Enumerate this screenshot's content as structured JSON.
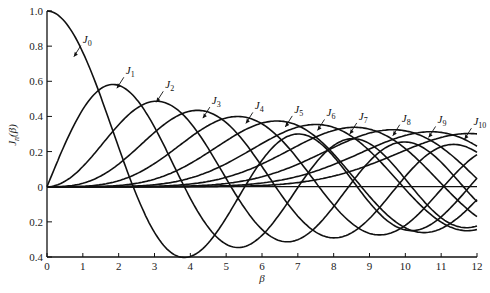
{
  "chart_data": {
    "type": "line",
    "title": "",
    "xlabel": "β",
    "ylabel": "J_n(β)",
    "xlim": [
      0,
      12
    ],
    "ylim": [
      -0.4,
      1.0
    ],
    "grid": false,
    "legend": "inline curve labels with arrows",
    "x_ticks": [
      "0",
      "1",
      "2",
      "3",
      "4",
      "5",
      "6",
      "7",
      "8",
      "9",
      "10",
      "11",
      "12"
    ],
    "y_ticks": [
      {
        "v": 1.0,
        "label": "1.0"
      },
      {
        "v": 0.8,
        "label": "0.8"
      },
      {
        "v": 0.6,
        "label": "0.6"
      },
      {
        "v": 0.4,
        "label": "0.4"
      },
      {
        "v": 0.2,
        "label": "0.2"
      },
      {
        "v": 0.0,
        "label": "0"
      },
      {
        "v": -0.2,
        "label": "0.2"
      },
      {
        "v": -0.4,
        "label": "0.4"
      }
    ],
    "x": [
      0,
      1,
      2,
      3,
      4,
      5,
      6,
      7,
      8,
      9,
      10,
      11,
      12
    ],
    "series": [
      {
        "name": "J0",
        "label_pos": [
          1.0,
          0.82
        ],
        "values": [
          1.0,
          0.765,
          0.224,
          -0.26,
          -0.397,
          -0.178,
          0.151,
          0.3,
          0.172,
          -0.09,
          -0.246,
          -0.171,
          0.048
        ]
      },
      {
        "name": "J1",
        "label_pos": [
          2.2,
          0.64
        ],
        "values": [
          0.0,
          0.44,
          0.577,
          0.339,
          -0.066,
          -0.328,
          -0.277,
          -0.005,
          0.235,
          0.245,
          0.043,
          -0.177,
          -0.223
        ]
      },
      {
        "name": "J2",
        "label_pos": [
          3.3,
          0.56
        ],
        "values": [
          0.0,
          0.115,
          0.353,
          0.486,
          0.364,
          0.047,
          -0.243,
          -0.301,
          -0.113,
          0.145,
          0.255,
          0.139,
          -0.085
        ]
      },
      {
        "name": "J3",
        "label_pos": [
          4.6,
          0.47
        ],
        "values": [
          0.0,
          0.02,
          0.129,
          0.309,
          0.43,
          0.365,
          0.115,
          -0.168,
          -0.291,
          -0.181,
          0.058,
          0.227,
          0.195
        ]
      },
      {
        "name": "J4",
        "label_pos": [
          5.8,
          0.44
        ],
        "values": [
          0.0,
          0.002,
          0.034,
          0.132,
          0.281,
          0.391,
          0.358,
          0.158,
          -0.105,
          -0.265,
          -0.22,
          -0.015,
          0.182
        ]
      },
      {
        "name": "J5",
        "label_pos": [
          6.9,
          0.42
        ],
        "values": [
          0.0,
          0.0,
          0.007,
          0.043,
          0.132,
          0.261,
          0.362,
          0.348,
          0.186,
          -0.055,
          -0.234,
          -0.238,
          -0.073
        ]
      },
      {
        "name": "J6",
        "label_pos": [
          7.8,
          0.4
        ],
        "values": [
          0.0,
          0.0,
          0.001,
          0.011,
          0.049,
          0.131,
          0.246,
          0.339,
          0.338,
          0.204,
          -0.014,
          -0.202,
          -0.244
        ]
      },
      {
        "name": "J7",
        "label_pos": [
          8.7,
          0.38
        ],
        "values": [
          0.0,
          0.0,
          0.0,
          0.003,
          0.015,
          0.053,
          0.13,
          0.234,
          0.321,
          0.327,
          0.217,
          0.018,
          -0.17
        ]
      },
      {
        "name": "J8",
        "label_pos": [
          9.9,
          0.37
        ],
        "values": [
          0.0,
          0.0,
          0.0,
          0.0,
          0.004,
          0.018,
          0.057,
          0.128,
          0.223,
          0.305,
          0.318,
          0.225,
          0.045
        ]
      },
      {
        "name": "J9",
        "label_pos": [
          10.9,
          0.36
        ],
        "values": [
          0.0,
          0.0,
          0.0,
          0.0,
          0.001,
          0.006,
          0.021,
          0.059,
          0.126,
          0.215,
          0.292,
          0.309,
          0.231
        ]
      },
      {
        "name": "J10",
        "label_pos": [
          11.9,
          0.35
        ],
        "values": [
          0.0,
          0.0,
          0.0,
          0.0,
          0.0,
          0.001,
          0.007,
          0.023,
          0.061,
          0.125,
          0.208,
          0.28,
          0.3
        ]
      }
    ]
  },
  "layout": {
    "plot": {
      "x0": 47,
      "x1": 477,
      "y_top": 11,
      "y_bottom": 257
    },
    "line_color": "#111111"
  }
}
